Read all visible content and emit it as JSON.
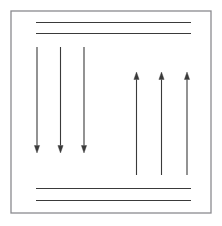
{
  "figure": {
    "type": "line-diagram",
    "canvas": {
      "width": 222,
      "height": 226,
      "background": "#ffffff"
    },
    "frame": {
      "name": "outer-border",
      "x": 11,
      "y": 11,
      "width": 200,
      "height": 202,
      "stroke": "#8a8a8f",
      "stroke_width": 1.3,
      "fill": "none"
    },
    "stroke_color": "#3a3a3a",
    "line_width": 1.1,
    "horizontal_lines": [
      {
        "name": "top-line-1",
        "x1": 36,
        "y1": 22.5,
        "x2": 191,
        "y2": 22.5
      },
      {
        "name": "top-line-2",
        "x1": 36,
        "y1": 33.5,
        "x2": 191,
        "y2": 33.5
      },
      {
        "name": "bottom-line-1",
        "x1": 36,
        "y1": 188.5,
        "x2": 191,
        "y2": 188.5
      },
      {
        "name": "bottom-line-2",
        "x1": 36,
        "y1": 200.5,
        "x2": 191,
        "y2": 200.5
      }
    ],
    "arrow_groups": [
      {
        "name": "downward-arrow-group",
        "direction": "down",
        "count": 3,
        "tail_y": 47,
        "head_y": 153,
        "x_positions": [
          37,
          60.5,
          84
        ]
      },
      {
        "name": "upward-arrow-group",
        "direction": "up",
        "count": 3,
        "tail_y": 175,
        "head_y": 72,
        "x_positions": [
          136.5,
          161.5,
          187
        ]
      }
    ],
    "arrowhead": {
      "length": 7.5,
      "half_width": 2.6
    }
  }
}
